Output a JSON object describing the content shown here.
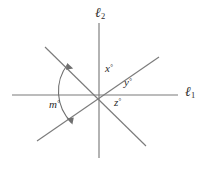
{
  "figure": {
    "type": "geometry-diagram",
    "width": 208,
    "height": 170,
    "background_color": "#ffffff",
    "stroke_color": "#7b7b7b",
    "text_color": "#2b2b2b"
  },
  "intersection": {
    "label": "common intersection point",
    "x": 99,
    "y": 95
  },
  "lines": [
    {
      "id": "l1",
      "name": "line-l1-horizontal",
      "label_text": "ℓ",
      "label_sub": "1",
      "orientation": "horizontal",
      "x1": 12,
      "y1": 95,
      "x2": 178,
      "y2": 95
    },
    {
      "id": "l2",
      "name": "line-l2-vertical",
      "label_text": "ℓ",
      "label_sub": "2",
      "orientation": "vertical",
      "x1": 99,
      "y1": 23,
      "x2": 99,
      "y2": 158
    },
    {
      "id": "d1",
      "name": "line-diagonal-northwest-southeast",
      "label_text": "",
      "label_sub": "",
      "orientation": "northwest-southeast",
      "x1": 45,
      "y1": 47,
      "x2": 146,
      "y2": 146
    },
    {
      "id": "d2",
      "name": "line-diagonal-southwest-northeast",
      "label_text": "",
      "label_sub": "",
      "orientation": "southwest-northeast",
      "x1": 37,
      "y1": 141,
      "x2": 159,
      "y2": 57
    }
  ],
  "angle_labels": [
    {
      "id": "x",
      "name": "angle-label-x",
      "variable": "x",
      "degree_symbol": "°",
      "description": "angle between upper vertical ray and upper-right diagonal ray",
      "x": 105,
      "y": 63
    },
    {
      "id": "y",
      "name": "angle-label-y",
      "variable": "y",
      "degree_symbol": "°",
      "description": "angle between upper-right diagonal ray and right horizontal ray",
      "x": 124,
      "y": 77
    },
    {
      "id": "z",
      "name": "angle-label-z",
      "variable": "z",
      "degree_symbol": "°",
      "description": "angle between right horizontal ray and lower-right diagonal ray",
      "x": 114,
      "y": 97
    },
    {
      "id": "m",
      "name": "angle-label-m",
      "variable": "m",
      "degree_symbol": "°",
      "description": "arc-marked angle between upper-left diagonal ray and lower-left diagonal ray",
      "x": 49,
      "y": 99
    }
  ],
  "arc": {
    "name": "angle-arc-m",
    "description": "double headed arc spanning from the upper-left diagonal ray to the lower-left diagonal ray",
    "center_x": 99,
    "center_y": 95,
    "radius": 44,
    "double_headed": true
  }
}
